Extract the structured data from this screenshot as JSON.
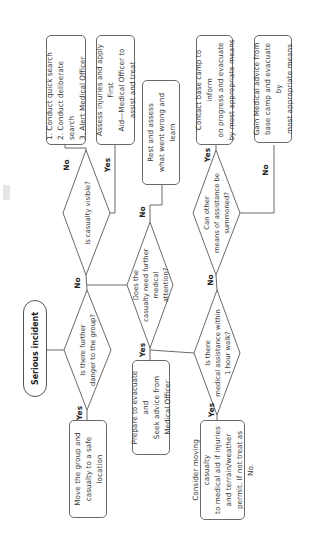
{
  "diagram": {
    "start": {
      "label": "Serious incident"
    },
    "decisions": {
      "further_danger": "Is there further\ndanger to the group?",
      "casualty_visible": "Is casualty visible?",
      "need_medical": "Does the\ncasualty need further medical\nattention?",
      "medical_within_hour": "Is there\nmedical assistance within\n1 hour walk?",
      "other_means": "Can other\nmeans of assistance be\nsummoned?"
    },
    "actions": {
      "move_group": "Move the group and\ncasualty to a safe location",
      "search": "1. Conduct quick search\n2. Conduct deliberate search\n3. Alert Medical Officer",
      "assess_injuries": "Assess injuries and apply First\nAid—Medical Officer to\nassist and treat",
      "rest_assess": "Rest and assess\nwhat went wrong and learn",
      "prepare_evacuate": "Prepare to evacuate and\nSeek advice from\nMedical Officer",
      "consider_moving": "Consider moving casualty\nto medical aid if injuries\nand terrain/weather\npermit. If not treat as No.",
      "contact_base": "Contact base camp to inform\non progress and evacuate\nby most appropriate means",
      "gain_advice": "Gain Medical advice from\nbase camp and evacuate by\nmost appropriate means"
    },
    "edge_labels": {
      "yes": "Yes",
      "no": "No"
    }
  }
}
